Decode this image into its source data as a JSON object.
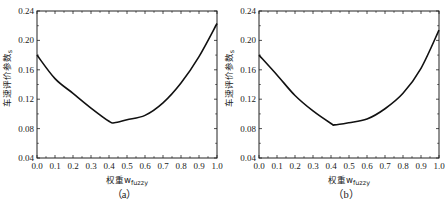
{
  "chart_data": [
    {
      "type": "line",
      "panel_label": "（a）",
      "title": "",
      "xlabel": "权重w",
      "xlabel_sub": "fuzzy",
      "ylabel": "车速评价参数",
      "ylabel_sub": "s",
      "xlim": [
        0.0,
        1.0
      ],
      "ylim": [
        0.04,
        0.24
      ],
      "xticks": [
        "0.0",
        "0.1",
        "0.2",
        "0.3",
        "0.4",
        "0.5",
        "0.6",
        "0.7",
        "0.8",
        "0.9",
        "1.0"
      ],
      "yticks": [
        "0.04",
        "0.08",
        "0.12",
        "0.16",
        "0.20",
        "0.24"
      ],
      "grid": false,
      "legend": null,
      "series": [
        {
          "name": "curve-a",
          "color": "#111111",
          "x": [
            0.0,
            0.1,
            0.2,
            0.3,
            0.4,
            0.43,
            0.5,
            0.6,
            0.7,
            0.8,
            0.9,
            1.0
          ],
          "y": [
            0.18,
            0.148,
            0.128,
            0.108,
            0.09,
            0.088,
            0.092,
            0.098,
            0.115,
            0.142,
            0.178,
            0.223
          ]
        }
      ]
    },
    {
      "type": "line",
      "panel_label": "（b）",
      "title": "",
      "xlabel": "权重w",
      "xlabel_sub": "fuzzy",
      "ylabel": "车速评价参数",
      "ylabel_sub": "s",
      "xlim": [
        0.0,
        1.0
      ],
      "ylim": [
        0.04,
        0.24
      ],
      "xticks": [
        "0.0",
        "0.1",
        "0.2",
        "0.3",
        "0.4",
        "0.5",
        "0.6",
        "0.7",
        "0.8",
        "0.9",
        "1.0"
      ],
      "yticks": [
        "0.04",
        "0.08",
        "0.12",
        "0.16",
        "0.20",
        "0.24"
      ],
      "grid": false,
      "legend": null,
      "series": [
        {
          "name": "curve-b",
          "color": "#111111",
          "x": [
            0.0,
            0.1,
            0.2,
            0.3,
            0.4,
            0.42,
            0.5,
            0.6,
            0.7,
            0.8,
            0.9,
            1.0
          ],
          "y": [
            0.18,
            0.153,
            0.125,
            0.104,
            0.087,
            0.085,
            0.088,
            0.093,
            0.107,
            0.128,
            0.162,
            0.214
          ]
        }
      ]
    }
  ],
  "panels": [
    {
      "left": 37,
      "right": 217,
      "top": 11,
      "bottom": 158
    },
    {
      "left": 259,
      "right": 439,
      "top": 11,
      "bottom": 158
    }
  ]
}
